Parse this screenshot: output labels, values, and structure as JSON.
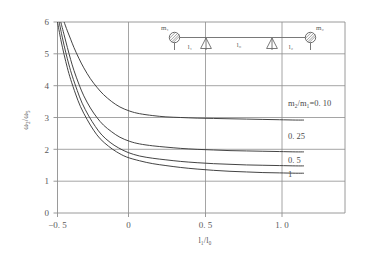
{
  "chart_data": {
    "type": "line",
    "title": "",
    "xlabel": "l₁/l₀",
    "ylabel": "ω₂/ω₅",
    "xlim": [
      -0.5,
      1.25
    ],
    "ylim": [
      0,
      6
    ],
    "grid": true,
    "legend_position": "inline-right",
    "xticks": [
      -0.5,
      0,
      0.5,
      1.0
    ],
    "xtick_labels": [
      "−0. 5",
      "0",
      "0. 5",
      "1. 0"
    ],
    "yticks": [
      0,
      1,
      2,
      3,
      4,
      5,
      6
    ],
    "ytick_labels": [
      "0",
      "1",
      "2",
      "3",
      "4",
      "5",
      "6"
    ],
    "series": [
      {
        "name": "m₂/m₁=0. 10",
        "label": "m₂/m₁=0. 10",
        "label_x": 1.03,
        "label_y": 3.22,
        "x": [
          -0.46,
          -0.44,
          -0.42,
          -0.4,
          -0.37,
          -0.34,
          -0.3,
          -0.26,
          -0.22,
          -0.17,
          -0.12,
          -0.06,
          0.0,
          0.08,
          0.16,
          0.25,
          0.35,
          0.45,
          0.55,
          0.65,
          0.75,
          0.85,
          0.95,
          1.0
        ],
        "y": [
          6.0,
          5.72,
          5.46,
          5.2,
          4.86,
          4.56,
          4.22,
          3.95,
          3.72,
          3.5,
          3.33,
          3.2,
          3.12,
          3.06,
          3.02,
          3.0,
          2.98,
          2.97,
          2.96,
          2.95,
          2.94,
          2.93,
          2.92,
          2.92
        ]
      },
      {
        "name": "0. 25",
        "label": "0. 25",
        "label_x": 1.03,
        "label_y": 2.13,
        "x": [
          -0.48,
          -0.46,
          -0.44,
          -0.42,
          -0.4,
          -0.37,
          -0.34,
          -0.3,
          -0.26,
          -0.22,
          -0.17,
          -0.12,
          -0.06,
          0.0,
          0.08,
          0.16,
          0.25,
          0.35,
          0.45,
          0.55,
          0.65,
          0.75,
          0.85,
          0.95,
          1.0
        ],
        "y": [
          6.0,
          5.6,
          5.2,
          4.82,
          4.48,
          4.05,
          3.68,
          3.3,
          3.0,
          2.76,
          2.55,
          2.38,
          2.25,
          2.17,
          2.11,
          2.07,
          2.03,
          2.0,
          1.98,
          1.96,
          1.95,
          1.94,
          1.93,
          1.92,
          1.92
        ]
      },
      {
        "name": "0. 5",
        "label": "0. 5",
        "label_x": 1.03,
        "label_y": 1.7,
        "x": [
          -0.49,
          -0.47,
          -0.45,
          -0.43,
          -0.41,
          -0.38,
          -0.35,
          -0.31,
          -0.27,
          -0.23,
          -0.18,
          -0.13,
          -0.07,
          0.0,
          0.08,
          0.16,
          0.25,
          0.35,
          0.45,
          0.55,
          0.65,
          0.75,
          0.85,
          0.95,
          1.0
        ],
        "y": [
          6.0,
          5.5,
          5.05,
          4.65,
          4.3,
          3.85,
          3.45,
          3.05,
          2.72,
          2.45,
          2.22,
          2.05,
          1.9,
          1.79,
          1.72,
          1.67,
          1.62,
          1.58,
          1.55,
          1.53,
          1.51,
          1.5,
          1.49,
          1.48,
          1.48
        ]
      },
      {
        "name": "1",
        "label": "1",
        "label_x": 1.03,
        "label_y": 1.38,
        "x": [
          -0.5,
          -0.48,
          -0.46,
          -0.44,
          -0.42,
          -0.39,
          -0.36,
          -0.32,
          -0.28,
          -0.24,
          -0.19,
          -0.14,
          -0.08,
          0.0,
          0.08,
          0.16,
          0.25,
          0.35,
          0.45,
          0.55,
          0.65,
          0.75,
          0.85,
          0.95,
          1.0
        ],
        "y": [
          6.0,
          5.45,
          4.98,
          4.56,
          4.2,
          3.74,
          3.34,
          2.94,
          2.6,
          2.33,
          2.1,
          1.92,
          1.76,
          1.64,
          1.55,
          1.49,
          1.43,
          1.38,
          1.34,
          1.31,
          1.29,
          1.27,
          1.26,
          1.25,
          1.25
        ]
      }
    ]
  },
  "axes": {
    "ylabel": "ω₂/ω₅",
    "xlabel": "l₁/l₀",
    "ytick_0": "0",
    "ytick_1": "1",
    "ytick_2": "2",
    "ytick_3": "3",
    "ytick_4": "4",
    "ytick_5": "5",
    "ytick_6": "6",
    "xtick_n05": "−0. 5",
    "xtick_0": "0",
    "xtick_05": "0. 5",
    "xtick_10": "1. 0"
  },
  "curve_labels": {
    "c1": "m₂/m₁=0. 10",
    "c2": "0. 25",
    "c3": "0. 5",
    "c4": "1"
  },
  "inset": {
    "mass_left": "m₁",
    "mass_right": "m₂",
    "span_left": "l₁",
    "span_mid": "l₀",
    "span_right": "l₂"
  },
  "colors": {
    "curve": "#3a3a3a",
    "grid": "#8e8e8e",
    "text": "#5a5a5a",
    "background": "#ffffff"
  }
}
